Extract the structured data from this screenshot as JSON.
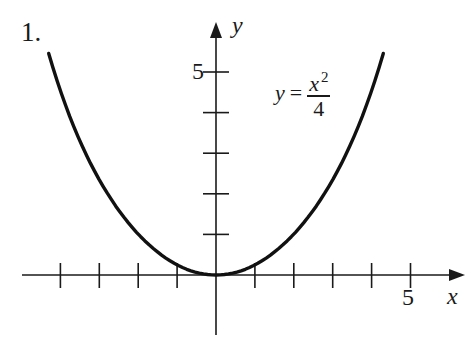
{
  "problem": {
    "number": "1."
  },
  "equation": {
    "lhs": "y",
    "equals": "=",
    "numerator": "x",
    "exponent": "2",
    "denominator": "4"
  },
  "axes": {
    "x_name": "x",
    "y_name": "y",
    "x_tick_label": "5",
    "y_tick_label": "5"
  },
  "style": {
    "ink": "#1a1a1a",
    "background": "#ffffff"
  },
  "chart_data": {
    "type": "line",
    "title": "",
    "function": "y = x^2 / 4",
    "xlabel": "x",
    "ylabel": "y",
    "xlim": [
      -5.0,
      6.5
    ],
    "ylim": [
      -1.5,
      6.5
    ],
    "x_ticks": [
      -4,
      -3,
      -2,
      -1,
      1,
      2,
      3,
      4,
      5
    ],
    "y_ticks": [
      1,
      2,
      3,
      4,
      5
    ],
    "labeled_x_ticks": {
      "5": "5"
    },
    "labeled_y_ticks": {
      "5": "5"
    },
    "grid": false,
    "legend": null,
    "series": [
      {
        "name": "y = x^2/4",
        "x": [
          -4.3,
          -4.0,
          -3.5,
          -3.0,
          -2.5,
          -2.0,
          -1.5,
          -1.0,
          -0.5,
          0.0,
          0.5,
          1.0,
          1.5,
          2.0,
          2.5,
          3.0,
          3.5,
          4.0,
          4.3
        ],
        "y": [
          4.62,
          4.0,
          3.06,
          2.25,
          1.56,
          1.0,
          0.56,
          0.25,
          0.06,
          0.0,
          0.06,
          0.25,
          0.56,
          1.0,
          1.56,
          2.25,
          3.06,
          4.0,
          4.62
        ]
      }
    ],
    "annotations": [
      {
        "text": "y = x²/4",
        "x": 2.0,
        "y": 4.8
      }
    ]
  }
}
